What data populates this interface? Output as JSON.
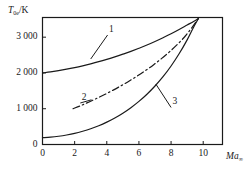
{
  "chart_data": {
    "type": "line",
    "title": "",
    "subtitle": "",
    "xlabel": "Ma",
    "xlabel_sub": "∞",
    "ylabel": "T",
    "ylabel_sub": "0e",
    "ylabel_unit": "/K",
    "xlim": [
      0,
      11.2
    ],
    "ylim": [
      0,
      3550
    ],
    "xticks": [
      0,
      2,
      4,
      6,
      8,
      10
    ],
    "xtick_labels": [
      "0",
      "2",
      "4",
      "6",
      "8",
      "10"
    ],
    "yticks": [
      0,
      1000,
      2000,
      3000
    ],
    "ytick_labels": [
      "0",
      "1 000",
      "2 000",
      "3 000"
    ],
    "grid": false,
    "legend": "inline-curve-numbers",
    "frame": "box",
    "series": [
      {
        "name": "1",
        "label": "1",
        "style": "solid",
        "color": "#1a1a1a",
        "x": [
          0.0,
          0.5,
          1.0,
          1.5,
          2.0,
          2.5,
          3.0,
          3.5,
          4.0,
          4.5,
          5.0,
          5.5,
          6.0,
          6.5,
          7.0,
          7.5,
          8.0,
          8.5,
          9.0,
          9.4,
          9.7
        ],
        "y": [
          2000,
          2030,
          2065,
          2105,
          2150,
          2200,
          2255,
          2315,
          2380,
          2450,
          2525,
          2605,
          2690,
          2780,
          2880,
          2985,
          3095,
          3215,
          3340,
          3440,
          3520
        ]
      },
      {
        "name": "2",
        "label": "2",
        "style": "dash-dot",
        "color": "#1a1a1a",
        "x": [
          1.9,
          2.4,
          2.9,
          3.4,
          3.9,
          4.4,
          4.9,
          5.4,
          5.9,
          6.4,
          6.9,
          7.4,
          7.9,
          8.4,
          8.9,
          9.3,
          9.7
        ],
        "y": [
          1000,
          1090,
          1190,
          1295,
          1405,
          1520,
          1645,
          1775,
          1915,
          2065,
          2225,
          2400,
          2590,
          2800,
          3040,
          3270,
          3520
        ]
      },
      {
        "name": "3",
        "label": "3",
        "style": "solid",
        "color": "#1a1a1a",
        "x": [
          0.0,
          0.5,
          1.0,
          1.5,
          2.0,
          2.5,
          3.0,
          3.5,
          4.0,
          4.5,
          5.0,
          5.5,
          6.0,
          6.5,
          7.0,
          7.5,
          8.0,
          8.5,
          9.0,
          9.4,
          9.7
        ],
        "y": [
          190,
          205,
          230,
          265,
          310,
          370,
          440,
          525,
          625,
          740,
          875,
          1030,
          1205,
          1405,
          1635,
          1895,
          2195,
          2535,
          2925,
          3280,
          3520
        ]
      }
    ],
    "annotations": [
      {
        "text": "1",
        "x": 4.05,
        "y": 3060,
        "leader_to_x": 3.0,
        "leader_to_y": 2390
      },
      {
        "text": "2",
        "x": 2.35,
        "y": 1160,
        "leader_to_x": 3.05,
        "leader_to_y": 1250
      },
      {
        "text": "3",
        "x": 8.0,
        "y": 1035,
        "leader_to_x": 7.05,
        "leader_to_y": 1690
      }
    ]
  }
}
